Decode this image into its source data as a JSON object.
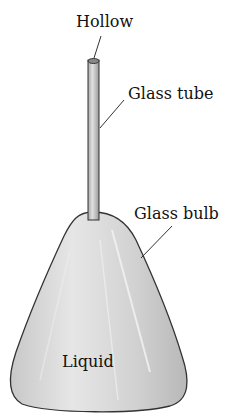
{
  "diagram": {
    "labels": {
      "hollow": "Hollow",
      "glass_tube": "Glass tube",
      "glass_bulb": "Glass bulb",
      "liquid": "Liquid"
    },
    "colors": {
      "glass_fill": "#d6d6d6",
      "outline": "#333333",
      "text": "#111111"
    }
  }
}
